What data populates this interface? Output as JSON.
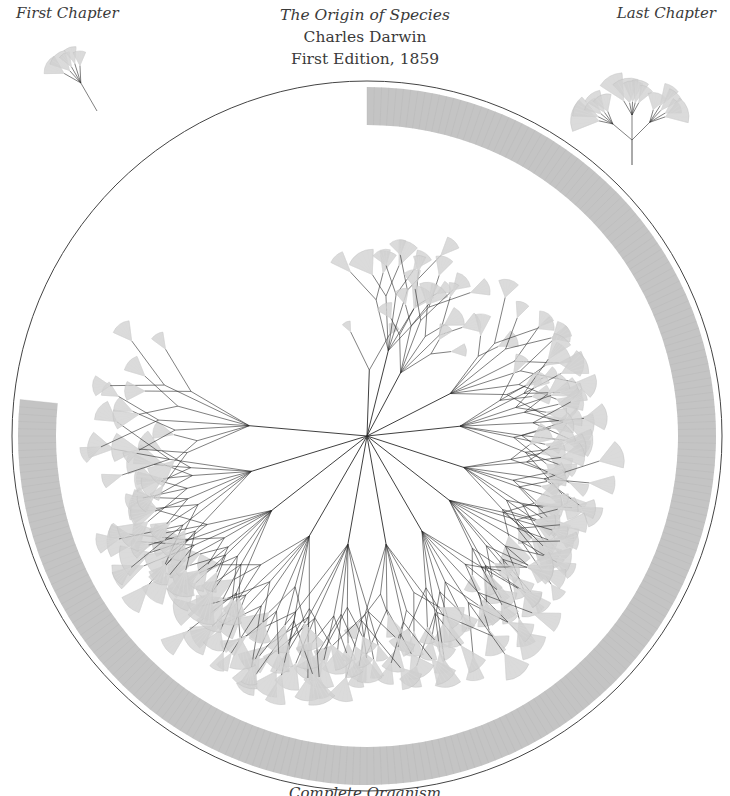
{
  "title": {
    "book": "The Origin of Species",
    "author": "Charles Darwin",
    "edition": "First Edition, 1859"
  },
  "labels": {
    "first_chapter": "First Chapter",
    "last_chapter": "Last Chapter",
    "complete_organism": "Complete Organism"
  },
  "colors": {
    "background": "#ffffff",
    "text": "#3a3a3a",
    "branch": "#2a2a2a",
    "leaf_fan": "#cfcfcf",
    "ring": "#c4c4c4",
    "outline": "#444444"
  },
  "main_diagram": {
    "center": [
      367,
      436
    ],
    "outer_circle_radius": 355,
    "ring": {
      "outer_radius": 349,
      "inner_radius": 311,
      "start_deg": 0,
      "end_deg": 276
    },
    "branches": [
      {
        "angle": 2,
        "length": 120,
        "children": 2,
        "fan": 14
      },
      {
        "angle": 14,
        "length": 160,
        "children": 6,
        "fan": 20
      },
      {
        "angle": 28,
        "length": 130,
        "children": 6,
        "fan": 18
      },
      {
        "angle": 63,
        "length": 170,
        "children": 7,
        "fan": 20
      },
      {
        "angle": 84,
        "length": 170,
        "children": 8,
        "fan": 22
      },
      {
        "angle": 108,
        "length": 185,
        "children": 8,
        "fan": 24
      },
      {
        "angle": 128,
        "length": 190,
        "children": 9,
        "fan": 22
      },
      {
        "angle": 150,
        "length": 200,
        "children": 8,
        "fan": 22
      },
      {
        "angle": 170,
        "length": 200,
        "children": 7,
        "fan": 22
      },
      {
        "angle": 190,
        "length": 200,
        "children": 8,
        "fan": 22
      },
      {
        "angle": 210,
        "length": 210,
        "children": 8,
        "fan": 24
      },
      {
        "angle": 232,
        "length": 220,
        "children": 9,
        "fan": 26
      },
      {
        "angle": 253,
        "length": 220,
        "children": 8,
        "fan": 24
      },
      {
        "angle": 275,
        "length": 215,
        "children": 7,
        "fan": 22
      }
    ]
  },
  "first_chapter_tree": {
    "root": [
      97,
      111
    ],
    "angle": -30,
    "length": 72,
    "children": 5,
    "fan": 16
  },
  "last_chapter_tree": {
    "root": [
      632,
      165
    ],
    "angle": 0,
    "length": 120,
    "children": 10,
    "fan": 22
  }
}
